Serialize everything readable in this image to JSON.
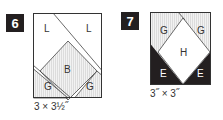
{
  "blocks": [
    {
      "number": "6",
      "size": "3 × 3½˝",
      "pieces": {
        "top_left": "L",
        "top_right": "L",
        "center": "B",
        "bottom_left": "G",
        "bottom_right": "G"
      }
    },
    {
      "number": "7",
      "size": "3˝ × 3˝",
      "pieces": {
        "top_left": "G",
        "top_right": "G",
        "center": "H",
        "bottom_left": "E",
        "bottom_right": "E"
      }
    }
  ],
  "colors": {
    "dark": "#231f20",
    "stripe": "#e6e6e6",
    "line": "#333333"
  }
}
